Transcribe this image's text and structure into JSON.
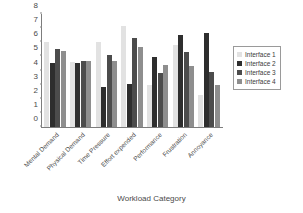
{
  "chart_data": {
    "type": "bar",
    "title": "",
    "subtitle": "",
    "xlabel": "Workload Category",
    "ylabel": "",
    "ylim": [
      0,
      8
    ],
    "yticks": [
      0,
      1,
      2,
      3,
      4,
      5,
      6,
      7,
      8
    ],
    "grid": false,
    "legend_position": "right",
    "categories": [
      "Mental Demand",
      "Physical Demand",
      "Time Pressure",
      "Effort expended",
      "Performance",
      "Frustration",
      "Annoyance"
    ],
    "series": [
      {
        "name": "Interface 1",
        "color": "#e2e2e2",
        "values": [
          6.0,
          4.6,
          6.05,
          7.15,
          3.0,
          5.8,
          2.25
        ]
      },
      {
        "name": "Interface 2",
        "color": "#2e2e2e",
        "values": [
          4.5,
          4.55,
          2.8,
          3.05,
          4.95,
          6.5,
          6.65
        ]
      },
      {
        "name": "Interface 3",
        "color": "#4c4c4c",
        "values": [
          5.5,
          4.7,
          5.1,
          6.3,
          3.85,
          5.3,
          3.9
        ]
      },
      {
        "name": "Interface 4",
        "color": "#8e8e8e",
        "values": [
          5.35,
          4.7,
          4.7,
          5.7,
          4.4,
          4.3,
          3.0
        ]
      }
    ]
  },
  "axis": {
    "x_title": "Workload Category"
  }
}
